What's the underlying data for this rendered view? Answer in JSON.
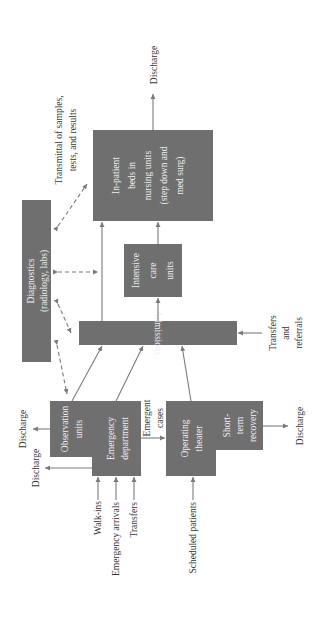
{
  "diagram": {
    "orientation": "rotated 90 degrees counter-clockwise",
    "colors": {
      "box_fill": "#6f6f6f",
      "box_text": "#f0f0f0",
      "line": "#7a7a7a",
      "label_text": "#333333"
    },
    "nodes": {
      "inpatient": {
        "lines": [
          "In-patient",
          "beds in",
          "nursing units",
          "(step down and",
          "med surg)"
        ]
      },
      "icu": {
        "lines": [
          "Intensive",
          "care",
          "units"
        ]
      },
      "admissions": {
        "label": "Admissions"
      },
      "diagnostics": {
        "lines": [
          "Diagnostics",
          "(radiology, labs)"
        ]
      },
      "observation": {
        "lines": [
          "Observation",
          "units"
        ]
      },
      "emergency": {
        "lines": [
          "Emergency",
          "department"
        ]
      },
      "operating": {
        "lines": [
          "Operating",
          "theater"
        ]
      },
      "recovery": {
        "lines": [
          "Short-",
          "term",
          "recovery"
        ]
      }
    },
    "labels": {
      "transmittal": [
        "Transmittal of samples,",
        "tests, and results"
      ],
      "discharge_inpatient": "Discharge",
      "discharge_observation": "Discharge",
      "discharge_emergency": "Discharge",
      "discharge_recovery": "Discharge",
      "transfers_referrals": [
        "Transfers",
        "and",
        "referrals"
      ],
      "emergent_cases": [
        "Emergent",
        "cases"
      ],
      "walk_ins": "Walk-ins",
      "emergency_arrivals": "Emergency arrivals",
      "transfers": "Transfers",
      "scheduled_patients": "Scheduled patients"
    }
  }
}
